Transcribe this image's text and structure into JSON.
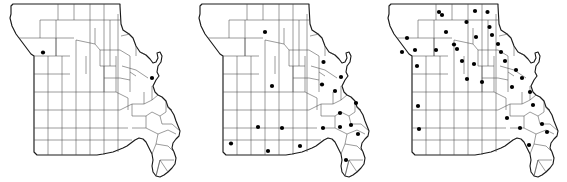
{
  "figure": {
    "title": "",
    "type": "three-panel-county-dot-map",
    "panel_count": 3,
    "region": "Missouri",
    "marker": {
      "shape": "filled-circle",
      "color": "#000000",
      "radius_px": 2.1,
      "meaning": "county occurrence record"
    },
    "outline_color": "#1a1a1a",
    "county_line_color": "#4a4a4a",
    "background_color": "#ffffff"
  },
  "chart_data": {
    "type": "scatter",
    "title": "",
    "subtitle": "",
    "xlabel": "",
    "ylabel": "",
    "legend": [],
    "grid": false,
    "panels": [
      {
        "index": 1,
        "label": "",
        "dot_count": 2,
        "dots": [
          {
            "x": 43.0,
            "y": 52.5
          },
          {
            "x": 152.0,
            "y": 78.0
          }
        ]
      },
      {
        "index": 2,
        "label": "",
        "dot_count": 18,
        "dots": [
          {
            "x": 264.0,
            "y": 32.0
          },
          {
            "x": 322.5,
            "y": 62.0
          },
          {
            "x": 340.0,
            "y": 77.0
          },
          {
            "x": 271.0,
            "y": 86.0
          },
          {
            "x": 321.0,
            "y": 84.5
          },
          {
            "x": 334.0,
            "y": 91.0
          },
          {
            "x": 355.0,
            "y": 103.0
          },
          {
            "x": 339.0,
            "y": 113.0
          },
          {
            "x": 257.0,
            "y": 127.0
          },
          {
            "x": 281.0,
            "y": 128.0
          },
          {
            "x": 322.0,
            "y": 128.0
          },
          {
            "x": 339.0,
            "y": 127.0
          },
          {
            "x": 350.0,
            "y": 125.0
          },
          {
            "x": 357.0,
            "y": 134.0
          },
          {
            "x": 230.0,
            "y": 143.5
          },
          {
            "x": 267.0,
            "y": 151.0
          },
          {
            "x": 299.0,
            "y": 146.0
          },
          {
            "x": 345.0,
            "y": 160.0
          }
        ]
      },
      {
        "index": 3,
        "label": "",
        "dot_count": 35,
        "dots": [
          {
            "x": 437.0,
            "y": 12.0
          },
          {
            "x": 473.0,
            "y": 11.0
          },
          {
            "x": 485.5,
            "y": 12.0
          },
          {
            "x": 464.5,
            "y": 22.0
          },
          {
            "x": 487.5,
            "y": 27.0
          },
          {
            "x": 490.0,
            "y": 35.0
          },
          {
            "x": 405.0,
            "y": 38.0
          },
          {
            "x": 452.0,
            "y": 44.5
          },
          {
            "x": 413.0,
            "y": 50.0
          },
          {
            "x": 434.0,
            "y": 50.0
          },
          {
            "x": 455.0,
            "y": 49.0
          },
          {
            "x": 415.0,
            "y": 66.0
          },
          {
            "x": 460.0,
            "y": 61.0
          },
          {
            "x": 472.0,
            "y": 64.0
          },
          {
            "x": 503.0,
            "y": 61.0
          },
          {
            "x": 465.0,
            "y": 79.0
          },
          {
            "x": 480.0,
            "y": 82.0
          },
          {
            "x": 514.0,
            "y": 70.0
          },
          {
            "x": 520.0,
            "y": 78.0
          },
          {
            "x": 510.0,
            "y": 87.0
          },
          {
            "x": 528.0,
            "y": 92.0
          },
          {
            "x": 416.0,
            "y": 106.0
          },
          {
            "x": 417.0,
            "y": 129.0
          },
          {
            "x": 531.0,
            "y": 105.0
          },
          {
            "x": 518.0,
            "y": 128.0
          },
          {
            "x": 540.0,
            "y": 124.0
          },
          {
            "x": 545.0,
            "y": 132.0
          },
          {
            "x": 527.0,
            "y": 145.0
          },
          {
            "x": 440.0,
            "y": 15.0
          },
          {
            "x": 400.0,
            "y": 52.0
          },
          {
            "x": 499.0,
            "y": 52.0
          },
          {
            "x": 496.0,
            "y": 44.0
          },
          {
            "x": 474.0,
            "y": 37.0
          },
          {
            "x": 444.0,
            "y": 32.0
          },
          {
            "x": 505.0,
            "y": 118.0
          }
        ]
      }
    ]
  }
}
